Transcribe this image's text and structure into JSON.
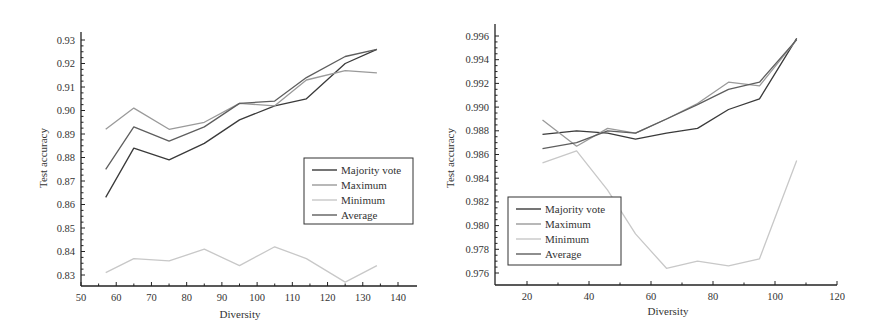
{
  "chart_data": [
    {
      "type": "line",
      "title": "",
      "xlabel": "Diversity",
      "ylabel": "Test accuracy",
      "xlim": [
        50,
        145
      ],
      "ylim": [
        0.825,
        0.935
      ],
      "xticks": [
        50,
        60,
        70,
        80,
        90,
        100,
        110,
        120,
        130,
        140
      ],
      "yticks": [
        0.83,
        0.84,
        0.85,
        0.86,
        0.87,
        0.88,
        0.89,
        0.9,
        0.91,
        0.92,
        0.93
      ],
      "ytick_labels": [
        "0.83",
        "0.84",
        "0.85",
        "0.86",
        "0.87",
        "0.88",
        "0.89",
        "0.90",
        "0.91",
        "0.92",
        "0.93"
      ],
      "grid": false,
      "legend_position": "center-right",
      "x": [
        57,
        65,
        75,
        85,
        95,
        105,
        114,
        125,
        134
      ],
      "series": [
        {
          "name": "Majority vote",
          "color": "#3a3a3a",
          "values": [
            0.863,
            0.884,
            0.879,
            0.886,
            0.896,
            0.902,
            0.905,
            0.92,
            0.926
          ]
        },
        {
          "name": "Maximum",
          "color": "#9a9a9a",
          "values": [
            0.892,
            0.901,
            0.892,
            0.895,
            0.903,
            0.902,
            0.913,
            0.917,
            0.916
          ]
        },
        {
          "name": "Minimum",
          "color": "#c8c8c8",
          "values": [
            0.831,
            0.837,
            0.836,
            0.841,
            0.834,
            0.842,
            0.837,
            0.827,
            0.834
          ]
        },
        {
          "name": "Average",
          "color": "#5e5e5e",
          "values": [
            0.875,
            0.893,
            0.887,
            0.893,
            0.903,
            0.904,
            0.914,
            0.923,
            0.926
          ]
        }
      ]
    },
    {
      "type": "line",
      "title": "",
      "xlabel": "Diversity",
      "ylabel": "Test accuracy",
      "xlim": [
        10,
        120
      ],
      "ylim": [
        0.975,
        0.997
      ],
      "xticks": [
        20,
        40,
        60,
        80,
        100,
        120
      ],
      "yticks": [
        0.976,
        0.978,
        0.98,
        0.982,
        0.984,
        0.986,
        0.988,
        0.99,
        0.992,
        0.994,
        0.996
      ],
      "ytick_labels": [
        "0.976",
        "0.978",
        "0.980",
        "0.982",
        "0.984",
        "0.986",
        "0.988",
        "0.990",
        "0.992",
        "0.994",
        "0.996"
      ],
      "grid": false,
      "legend_position": "lower-left",
      "x": [
        25,
        36,
        46,
        55,
        65,
        75,
        85,
        95,
        107
      ],
      "series": [
        {
          "name": "Majority vote",
          "color": "#3a3a3a",
          "values": [
            0.9877,
            0.988,
            0.9878,
            0.9873,
            0.9878,
            0.9882,
            0.9898,
            0.9907,
            0.9958
          ]
        },
        {
          "name": "Maximum",
          "color": "#9a9a9a",
          "values": [
            0.9889,
            0.9867,
            0.9882,
            0.9878,
            0.989,
            0.9903,
            0.9921,
            0.9918,
            0.9957
          ]
        },
        {
          "name": "Minimum",
          "color": "#c8c8c8",
          "values": [
            0.9853,
            0.9863,
            0.983,
            0.9793,
            0.9764,
            0.977,
            0.9766,
            0.9772,
            0.9855
          ]
        },
        {
          "name": "Average",
          "color": "#5e5e5e",
          "values": [
            0.9865,
            0.987,
            0.988,
            0.9878,
            0.989,
            0.9902,
            0.9915,
            0.9921,
            0.9957
          ]
        }
      ]
    }
  ],
  "charts": [
    {
      "xlabel": "Diversity",
      "ylabel": "Test accuracy",
      "legend": [
        "Majority vote",
        "Maximum",
        "Minimum",
        "Average"
      ]
    },
    {
      "xlabel": "Diversity",
      "ylabel": "Test accuracy",
      "legend": [
        "Majority vote",
        "Maximum",
        "Minimum",
        "Average"
      ]
    }
  ]
}
